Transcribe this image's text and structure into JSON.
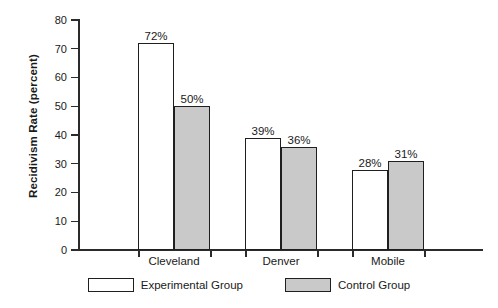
{
  "chart_data": {
    "type": "bar",
    "title": "",
    "xlabel": "",
    "ylabel": "Recidivism Rate (percent)",
    "ylim": [
      0,
      80
    ],
    "yticks": [
      0,
      10,
      20,
      30,
      40,
      50,
      60,
      70,
      80
    ],
    "ytick_labels": [
      "0",
      "10",
      "20",
      "30",
      "40",
      "50",
      "60",
      "70",
      "80"
    ],
    "grid": false,
    "legend_position": "bottom-center",
    "categories": [
      "Cleveland",
      "Denver",
      "Mobile"
    ],
    "series": [
      {
        "name": "Experimental Group",
        "fill": "#ffffff",
        "values": [
          72,
          39,
          28
        ],
        "data_labels": [
          "72%",
          "39%",
          "28%"
        ]
      },
      {
        "name": "Control Group",
        "fill": "#c9c9c9",
        "values": [
          50,
          36,
          31
        ],
        "data_labels": [
          "50%",
          "36%",
          "31%"
        ]
      }
    ]
  },
  "colors": {
    "axis": "#2b2b2b",
    "bar_outline": "#1f1f1f",
    "experimental_fill": "#ffffff",
    "control_fill": "#c9c9c9",
    "background": "#ffffff"
  }
}
